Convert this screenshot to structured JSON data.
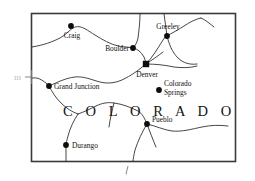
{
  "map": {
    "state_name": "C O L O R A D O",
    "state_name_plain": "COLORADO",
    "margin_left_note": "III",
    "margin_bottom_note": "/",
    "capital_marker_name": "square",
    "city_marker_name": "dot",
    "colors": {
      "border": "#3a3a3a",
      "river": "#262626",
      "marker": "#0d0d0d",
      "label": "#111111",
      "background": "#ffffff"
    },
    "cities": [
      {
        "name": "Craig",
        "label": "Craig",
        "x": 71,
        "y": 26,
        "label_x": 72,
        "label_y": 38,
        "anchor": "middle",
        "marker": "dot",
        "lines": [
          "Craig"
        ]
      },
      {
        "name": "Boulder",
        "label": "Boulder",
        "x": 133,
        "y": 48,
        "label_x": 129,
        "label_y": 51,
        "anchor": "end",
        "marker": "dot",
        "lines": [
          "Boulder"
        ]
      },
      {
        "name": "Greeley",
        "label": "Greeley",
        "x": 167,
        "y": 36,
        "label_x": 168,
        "label_y": 29,
        "anchor": "middle",
        "marker": "dot",
        "lines": [
          "Greeley"
        ]
      },
      {
        "name": "Denver",
        "label": "Denver",
        "x": 146,
        "y": 64,
        "label_x": 147,
        "label_y": 77,
        "anchor": "middle",
        "marker": "square",
        "lines": [
          "Denver"
        ]
      },
      {
        "name": "Colorado Springs",
        "label": "Colorado Springs",
        "x": 159,
        "y": 90,
        "label_x": 164,
        "label_y": 86,
        "anchor": "start",
        "marker": "dot",
        "lines": [
          "Colorado",
          "Springs"
        ]
      },
      {
        "name": "Grand Junction",
        "label": "Grand Junction",
        "x": 49,
        "y": 86,
        "label_x": 54,
        "label_y": 89,
        "anchor": "start",
        "marker": "dot",
        "lines": [
          "Grand Junction"
        ]
      },
      {
        "name": "Pueblo",
        "label": "Pueblo",
        "x": 147,
        "y": 124,
        "label_x": 152,
        "label_y": 122,
        "anchor": "start",
        "marker": "dot",
        "lines": [
          "Pueblo"
        ]
      },
      {
        "name": "Durango",
        "label": "Durango",
        "x": 66,
        "y": 145,
        "label_x": 72,
        "label_y": 148,
        "anchor": "start",
        "marker": "dot",
        "lines": [
          "Durango"
        ]
      }
    ],
    "state_name_pos": {
      "x": 63,
      "y": 116
    },
    "border_rect": {
      "x": 31,
      "y": 13,
      "width": 205,
      "height": 149
    }
  }
}
